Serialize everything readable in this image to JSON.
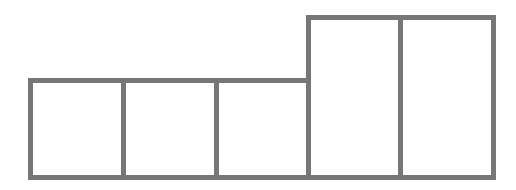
{
  "diagram": {
    "type": "block-grid",
    "stroke_color": "#777777",
    "fill_color": "#ffffff",
    "stroke_width": 5,
    "baseline_y": 177.5,
    "cells": [
      {
        "id": "cell-1",
        "x": 30.5,
        "y": 80.5,
        "width": 93,
        "height": 97,
        "group": "short"
      },
      {
        "id": "cell-2",
        "x": 123.5,
        "y": 80.5,
        "width": 93,
        "height": 97,
        "group": "short"
      },
      {
        "id": "cell-3",
        "x": 216.5,
        "y": 80.5,
        "width": 92,
        "height": 97,
        "group": "short"
      },
      {
        "id": "cell-4",
        "x": 308.5,
        "y": 17.5,
        "width": 92,
        "height": 160,
        "group": "tall"
      },
      {
        "id": "cell-5",
        "x": 400.5,
        "y": 17.5,
        "width": 93,
        "height": 160,
        "group": "tall"
      }
    ]
  }
}
